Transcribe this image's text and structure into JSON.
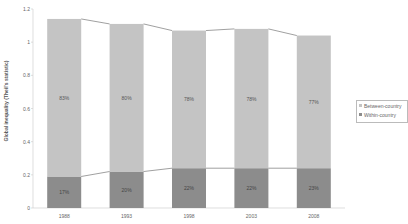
{
  "chart_data": {
    "type": "bar",
    "stacked": true,
    "title": "",
    "xlabel": "",
    "ylabel": "Global inequality (Theil's statistic)",
    "ylim": [
      0,
      1.2
    ],
    "yticks": [
      "0",
      "0.2",
      "0.4",
      "0.6",
      "0.8",
      "1",
      "1.2"
    ],
    "categories": [
      "1988",
      "1993",
      "1998",
      "2003",
      "2008"
    ],
    "series": [
      {
        "name": "Within-country",
        "color": "#8c8c8c",
        "values": [
          0.19,
          0.22,
          0.24,
          0.24,
          0.24
        ],
        "labels": [
          "17%",
          "20%",
          "22%",
          "22%",
          "23%"
        ]
      },
      {
        "name": "Between-country",
        "color": "#c4c4c4",
        "values": [
          0.95,
          0.89,
          0.83,
          0.84,
          0.8
        ],
        "labels": [
          "83%",
          "80%",
          "78%",
          "78%",
          "77%"
        ]
      }
    ],
    "totals": [
      1.14,
      1.11,
      1.07,
      1.08,
      1.04
    ],
    "legend_position": "right",
    "grid": false
  },
  "legend": {
    "items": [
      {
        "label": "Between-country",
        "color": "#c4c4c4"
      },
      {
        "label": "Within-country",
        "color": "#8c8c8c"
      }
    ]
  }
}
